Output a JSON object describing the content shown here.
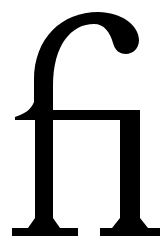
{
  "glyph": {
    "character": "ﬁ",
    "name": "fi ligature",
    "color": "#000000",
    "background": "#ffffff"
  }
}
